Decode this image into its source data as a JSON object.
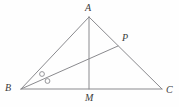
{
  "figure": {
    "kind": "geometry-diagram",
    "background_color": "#fefefe",
    "stroke_color": "#8a8a8e",
    "label_color": "#3b3b3b",
    "labels": {
      "a": "A",
      "b": "B",
      "c": "C",
      "m": "M",
      "p": "P"
    },
    "points": {
      "A": {
        "x": 89,
        "y": 17
      },
      "B": {
        "x": 21,
        "y": 89
      },
      "C": {
        "x": 162,
        "y": 89
      },
      "M": {
        "x": 89,
        "y": 89
      },
      "P": {
        "x": 118,
        "y": 46
      }
    },
    "label_positions": {
      "A": {
        "x": 85,
        "y": 3
      },
      "B": {
        "x": 5,
        "y": 83
      },
      "C": {
        "x": 166,
        "y": 85
      },
      "M": {
        "x": 85,
        "y": 93
      },
      "P": {
        "x": 122,
        "y": 33
      }
    },
    "segments": [
      {
        "name": "side-ab",
        "from": "A",
        "to": "B"
      },
      {
        "name": "side-bc",
        "from": "B",
        "to": "C"
      },
      {
        "name": "side-ac",
        "from": "A",
        "to": "C"
      },
      {
        "name": "median-am",
        "from": "A",
        "to": "M"
      },
      {
        "name": "cevian-bp",
        "from": "B",
        "to": "P"
      }
    ],
    "angle_marks": [
      {
        "name": "angle-mark-abp",
        "x": 42,
        "y": 74,
        "r": 2.4
      },
      {
        "name": "angle-mark-pbc",
        "x": 47.5,
        "y": 81,
        "r": 2.4
      }
    ]
  }
}
